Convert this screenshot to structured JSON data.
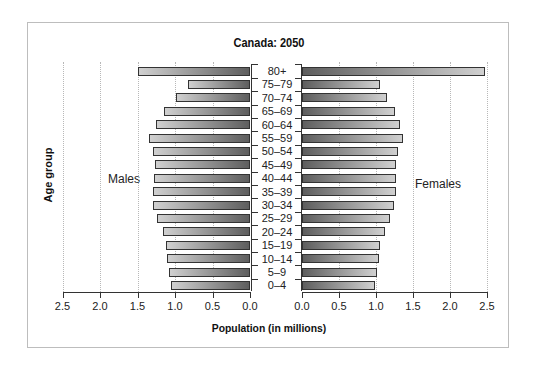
{
  "chart_data": {
    "type": "bar",
    "subtype": "population-pyramid",
    "title": "Canada: 2050",
    "xlabel": "Population (in millions)",
    "ylabel": "Age group",
    "categories": [
      "0–4",
      "5–9",
      "10–14",
      "15–19",
      "20–24",
      "25–29",
      "30–34",
      "35–39",
      "40–44",
      "45–49",
      "50–54",
      "55–59",
      "60–64",
      "65–69",
      "70–74",
      "75–79",
      "80+"
    ],
    "series": [
      {
        "name": "Males",
        "side": "left",
        "values": [
          1.05,
          1.08,
          1.11,
          1.12,
          1.16,
          1.24,
          1.29,
          1.29,
          1.28,
          1.27,
          1.29,
          1.35,
          1.25,
          1.15,
          0.99,
          0.83,
          1.5
        ]
      },
      {
        "name": "Females",
        "side": "right",
        "values": [
          0.99,
          1.01,
          1.04,
          1.05,
          1.12,
          1.19,
          1.24,
          1.27,
          1.27,
          1.27,
          1.3,
          1.37,
          1.32,
          1.26,
          1.15,
          1.05,
          2.47
        ]
      }
    ],
    "x_ticks_left": [
      "2.5",
      "2.0",
      "1.5",
      "1.0",
      "0.5",
      "0.0"
    ],
    "x_ticks_right": [
      "0.0",
      "0.5",
      "1.0",
      "1.5",
      "2.0",
      "2.5"
    ],
    "xlim": [
      0,
      2.5
    ],
    "grid": true,
    "legend": "inline side labels"
  },
  "labels": {
    "title": "Canada: 2050",
    "xlabel": "Population (in millions)",
    "ylabel": "Age group",
    "males": "Males",
    "females": "Females"
  }
}
